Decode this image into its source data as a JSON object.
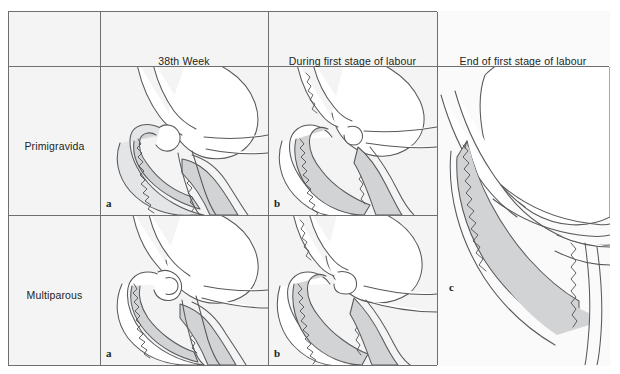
{
  "figure": {
    "background_color": "#ffffff",
    "panel_background": "#f4f4f4",
    "border_color": "#6d6f71",
    "line_color": "#58595b",
    "shade_color": "#d2d3d4",
    "shade_color_light": "#e4e5e6"
  },
  "header": {
    "corner_label": "",
    "columns": [
      {
        "label": "38th Week"
      },
      {
        "label": "During first stage of labour"
      },
      {
        "label": "End of first stage of labour"
      }
    ]
  },
  "rows": [
    {
      "label": "Primigravida"
    },
    {
      "label": "Multiparous"
    }
  ],
  "panels": [
    {
      "row": "Primigravida",
      "column": "38th Week",
      "letter": "a",
      "description": "Uncoloured cervix with long canal, internal and external os closed"
    },
    {
      "row": "Primigravida",
      "column": "During first stage of labour",
      "letter": "b",
      "description": "Cervix fully effaced, canal taken up, os beginning to dilate"
    },
    {
      "row": "Primigravida + Multiparous",
      "column": "End of first stage of labour",
      "letter": "c",
      "description": "Cervix fully dilated, no cervical rim remaining"
    },
    {
      "row": "Multiparous",
      "column": "38th Week",
      "letter": "a",
      "description": "Cervix with canal partially open, effacement and dilatation together"
    },
    {
      "row": "Multiparous",
      "column": "During first stage of labour",
      "letter": "b",
      "description": "Cervix dilating while effacement continues"
    }
  ]
}
